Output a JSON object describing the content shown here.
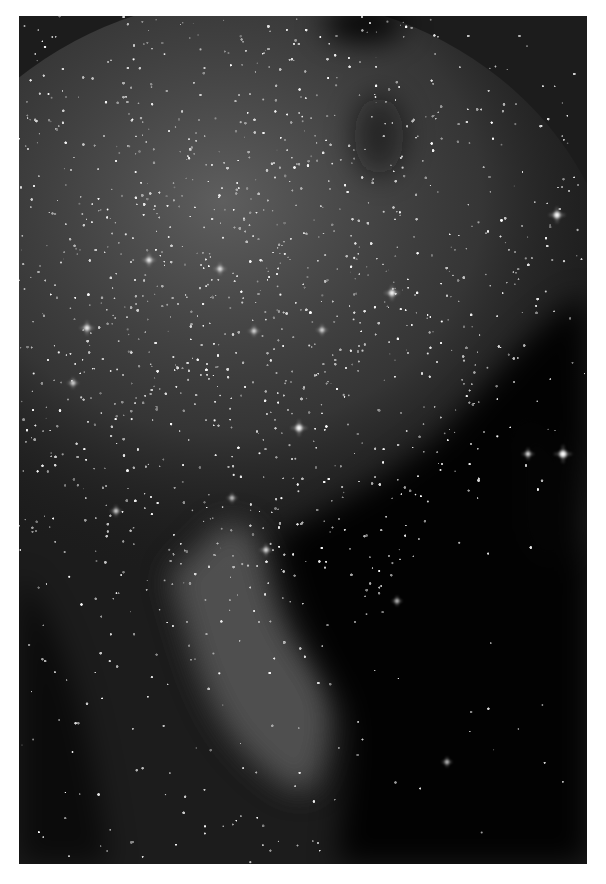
{
  "image": {
    "subject": "star field with emission nebula (grayscale astrophotography)",
    "frame": {
      "x": 19,
      "y": 16,
      "width": 568,
      "height": 848
    },
    "colors": {
      "page_background": "#ffffff",
      "sky_dark": "#0b0b0b",
      "milky_way_haze": "#4a4a4a",
      "nebula_glow": "#6a6a6a",
      "star": "#ffffff"
    },
    "bright_stars": [
      {
        "x": 538,
        "y": 199,
        "r": 3.2
      },
      {
        "x": 373,
        "y": 277,
        "r": 3
      },
      {
        "x": 130,
        "y": 244,
        "r": 2.6
      },
      {
        "x": 201,
        "y": 253,
        "r": 2.4
      },
      {
        "x": 68,
        "y": 312,
        "r": 2.8
      },
      {
        "x": 54,
        "y": 367,
        "r": 2.2
      },
      {
        "x": 235,
        "y": 315,
        "r": 2.2
      },
      {
        "x": 303,
        "y": 314,
        "r": 2.2
      },
      {
        "x": 280,
        "y": 412,
        "r": 3.2
      },
      {
        "x": 544,
        "y": 438,
        "r": 3.6
      },
      {
        "x": 509,
        "y": 438,
        "r": 2.4
      },
      {
        "x": 97,
        "y": 495,
        "r": 2.2
      },
      {
        "x": 247,
        "y": 534,
        "r": 2.4
      },
      {
        "x": 213,
        "y": 482,
        "r": 2
      },
      {
        "x": 378,
        "y": 585,
        "r": 2
      },
      {
        "x": 428,
        "y": 746,
        "r": 2
      }
    ]
  }
}
